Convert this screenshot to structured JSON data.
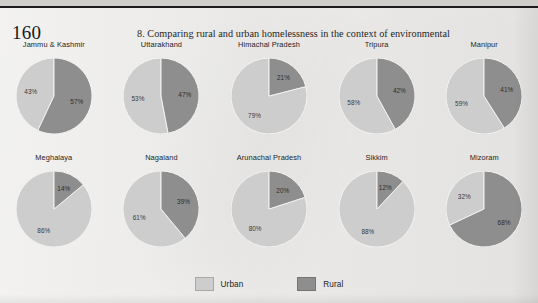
{
  "page": {
    "folio": "160",
    "running_title": "8. Comparing rural and urban homelessness in the context of environmental"
  },
  "legend": {
    "items": [
      {
        "label": "Urban",
        "color": "#cdcdcd"
      },
      {
        "label": "Rural",
        "color": "#8e8e8e"
      }
    ]
  },
  "colors": {
    "urban": "#cdcdcd",
    "rural": "#8e8e8e",
    "paper": "#f4f3f1",
    "rule": "#1c1c1c"
  },
  "chart_data": {
    "type": "pie",
    "title": "",
    "legend_position": "bottom",
    "series_names": [
      "Urban",
      "Rural"
    ],
    "charts": [
      {
        "title": "Jammu & Kashmir",
        "categories": [
          "Urban",
          "Rural"
        ],
        "values": [
          43,
          57
        ],
        "labels": [
          "43%",
          "57%"
        ]
      },
      {
        "title": "Uttarakhand",
        "categories": [
          "Urban",
          "Rural"
        ],
        "values": [
          53,
          47
        ],
        "labels": [
          "53%",
          "47%"
        ]
      },
      {
        "title": "Himachal Pradesh",
        "categories": [
          "Urban",
          "Rural"
        ],
        "values": [
          79,
          21
        ],
        "labels": [
          "79%",
          "21%"
        ]
      },
      {
        "title": "Tripura",
        "categories": [
          "Urban",
          "Rural"
        ],
        "values": [
          58,
          42
        ],
        "labels": [
          "58%",
          "42%"
        ]
      },
      {
        "title": "Manipur",
        "categories": [
          "Urban",
          "Rural"
        ],
        "values": [
          59,
          41
        ],
        "labels": [
          "59%",
          "41%"
        ]
      },
      {
        "title": "Meghalaya",
        "categories": [
          "Urban",
          "Rural"
        ],
        "values": [
          86,
          14
        ],
        "labels": [
          "86%",
          "14%"
        ]
      },
      {
        "title": "Nagaland",
        "categories": [
          "Urban",
          "Rural"
        ],
        "values": [
          61,
          39
        ],
        "labels": [
          "61%",
          "39%"
        ]
      },
      {
        "title": "Arunachal Pradesh",
        "categories": [
          "Urban",
          "Rural"
        ],
        "values": [
          80,
          20
        ],
        "labels": [
          "80%",
          "20%"
        ]
      },
      {
        "title": "Sikkim",
        "categories": [
          "Urban",
          "Rural"
        ],
        "values": [
          88,
          12
        ],
        "labels": [
          "88%",
          "12%"
        ]
      },
      {
        "title": "Mizoram",
        "categories": [
          "Urban",
          "Rural"
        ],
        "values": [
          32,
          68
        ],
        "labels": [
          "32%",
          "68%"
        ]
      }
    ]
  }
}
